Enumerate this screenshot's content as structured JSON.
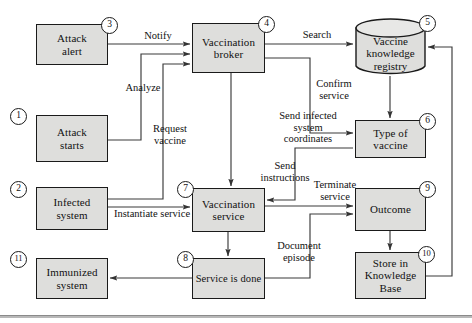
{
  "diagram": {
    "colors": {
      "node_fill": "#dededc",
      "node_stroke": "#1a1a1a",
      "edge_stroke": "#3a3a3a",
      "badge_fill": "#ffffff",
      "background": "#ffffff",
      "rule": "#b8b8b8"
    },
    "nodes": [
      {
        "id": "attack-alert",
        "number": "3",
        "label": "Attack\nalert",
        "shape": "rect",
        "x": 36,
        "y": 24,
        "w": 72,
        "h": 41
      },
      {
        "id": "vaccination-broker",
        "number": "4",
        "label": "Vaccination\nbroker",
        "shape": "rect",
        "x": 192,
        "y": 23,
        "w": 73,
        "h": 50
      },
      {
        "id": "vaccine-knowledge-registry",
        "number": "5",
        "label": "Vaccine\nknowledge\nregistry",
        "shape": "cylinder",
        "x": 355,
        "y": 18,
        "w": 71,
        "h": 58
      },
      {
        "id": "attack-starts",
        "number": "1",
        "label": "Attack\nstarts",
        "shape": "rect",
        "x": 36,
        "y": 115,
        "w": 72,
        "h": 47
      },
      {
        "id": "type-of-vaccine",
        "number": "6",
        "label": "Type of\nvaccine",
        "shape": "rect",
        "x": 355,
        "y": 120,
        "w": 71,
        "h": 38
      },
      {
        "id": "infected-system",
        "number": "2",
        "label": "Infected\nsystem",
        "shape": "rect",
        "x": 36,
        "y": 187,
        "w": 72,
        "h": 43
      },
      {
        "id": "vaccination-service",
        "number": "7",
        "label": "Vaccination\nservice",
        "shape": "rect",
        "x": 192,
        "y": 188,
        "w": 73,
        "h": 44
      },
      {
        "id": "outcome",
        "number": "9",
        "label": "Outcome",
        "shape": "rect",
        "x": 355,
        "y": 188,
        "w": 71,
        "h": 43
      },
      {
        "id": "immunized-system",
        "number": "11",
        "label": "Immunized\nsystem",
        "shape": "rect",
        "x": 36,
        "y": 258,
        "w": 72,
        "h": 41
      },
      {
        "id": "service-is-done",
        "number": "8",
        "label": "Service is done",
        "shape": "rect",
        "x": 192,
        "y": 258,
        "w": 73,
        "h": 41
      },
      {
        "id": "store-in-knowledge-base",
        "number": "10",
        "label": "Store in\nKnowledge\nBase",
        "shape": "rect",
        "x": 355,
        "y": 252,
        "w": 71,
        "h": 47
      }
    ],
    "edges": [
      {
        "id": "notify",
        "label": "Notify",
        "from": "attack-alert",
        "to": "vaccination-broker"
      },
      {
        "id": "analyze",
        "label": "Analyze",
        "from": "attack-starts",
        "to": "vaccination-broker"
      },
      {
        "id": "request-vaccine",
        "label": "Request\nvaccine",
        "from": "infected-system",
        "to": "vaccination-broker"
      },
      {
        "id": "search",
        "label": "Search",
        "from": "vaccination-broker",
        "to": "vaccine-knowledge-registry"
      },
      {
        "id": "confirm-service",
        "label": "Confirm\nservice",
        "from": "vaccination-broker",
        "to": "type-of-vaccine"
      },
      {
        "id": "registry-to-type",
        "label": "",
        "from": "vaccine-knowledge-registry",
        "to": "type-of-vaccine"
      },
      {
        "id": "send-infected-coordinates",
        "label": "Send infected\nsystem\ncoordinates",
        "from": "vaccination-broker",
        "to": "vaccination-service"
      },
      {
        "id": "send-instructions",
        "label": "Send\ninstructions",
        "from": "type-of-vaccine",
        "to": "vaccination-service"
      },
      {
        "id": "instantiate-service",
        "label": "Instantiate service",
        "from": "infected-system",
        "to": "vaccination-service"
      },
      {
        "id": "terminate-service",
        "label": "Terminate\nservice",
        "from": "vaccination-service",
        "to": "outcome"
      },
      {
        "id": "document-episode",
        "label": "Document\nepisode",
        "from": "service-is-done",
        "to": "outcome"
      },
      {
        "id": "service-to-done",
        "label": "",
        "from": "vaccination-service",
        "to": "service-is-done"
      },
      {
        "id": "done-to-immunized",
        "label": "",
        "from": "service-is-done",
        "to": "immunized-system"
      },
      {
        "id": "outcome-to-store",
        "label": "",
        "from": "outcome",
        "to": "store-in-knowledge-base"
      },
      {
        "id": "store-to-registry",
        "label": "",
        "from": "store-in-knowledge-base",
        "to": "vaccine-knowledge-registry"
      }
    ],
    "edge_labels": [
      {
        "id": "notify",
        "text": "Notify",
        "x": 128,
        "y": 30,
        "w": 60
      },
      {
        "id": "analyze",
        "text": "Analyze",
        "x": 110,
        "y": 82,
        "w": 66
      },
      {
        "id": "request-vaccine",
        "text": "Request\nvaccine",
        "x": 141,
        "y": 123,
        "w": 58
      },
      {
        "id": "search",
        "text": "Search",
        "x": 288,
        "y": 29,
        "w": 58
      },
      {
        "id": "confirm-service",
        "text": "Confirm\nservice",
        "x": 303,
        "y": 78,
        "w": 62
      },
      {
        "id": "send-infected-coordinates",
        "text": "Send infected\nsystem\ncoordinates",
        "x": 268,
        "y": 110,
        "w": 80
      },
      {
        "id": "send-instructions",
        "text": "Send\ninstructions",
        "x": 252,
        "y": 160,
        "w": 66
      },
      {
        "id": "instantiate-service",
        "text": "Instantiate service",
        "x": 106,
        "y": 208,
        "w": 92
      },
      {
        "id": "terminate-service",
        "text": "Terminate\nservice",
        "x": 303,
        "y": 179,
        "w": 64
      },
      {
        "id": "document-episode",
        "text": "Document\nepisode",
        "x": 265,
        "y": 240,
        "w": 68
      }
    ],
    "footer_rule": {
      "y": 315
    }
  }
}
